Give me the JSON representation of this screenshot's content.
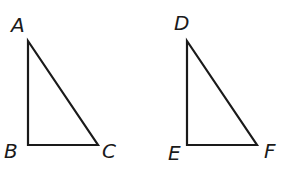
{
  "diagram": {
    "type": "geometry",
    "triangles": [
      {
        "name": "triangle-abc",
        "vertices": [
          {
            "label": "A",
            "x": 28,
            "y": 41,
            "label_x": 11,
            "label_y": 32
          },
          {
            "label": "B",
            "x": 28,
            "y": 145,
            "label_x": 4,
            "label_y": 158
          },
          {
            "label": "C",
            "x": 98,
            "y": 145,
            "label_x": 102,
            "label_y": 158
          }
        ],
        "right_angle_at": "B"
      },
      {
        "name": "triangle-def",
        "vertices": [
          {
            "label": "D",
            "x": 187,
            "y": 41,
            "label_x": 174,
            "label_y": 30
          },
          {
            "label": "E",
            "x": 187,
            "y": 145,
            "label_x": 168,
            "label_y": 160
          },
          {
            "label": "F",
            "x": 257,
            "y": 145,
            "label_x": 264,
            "label_y": 158
          }
        ],
        "right_angle_at": "E"
      }
    ],
    "colors": {
      "stroke": "#1a1a1a",
      "background": "#ffffff"
    }
  }
}
